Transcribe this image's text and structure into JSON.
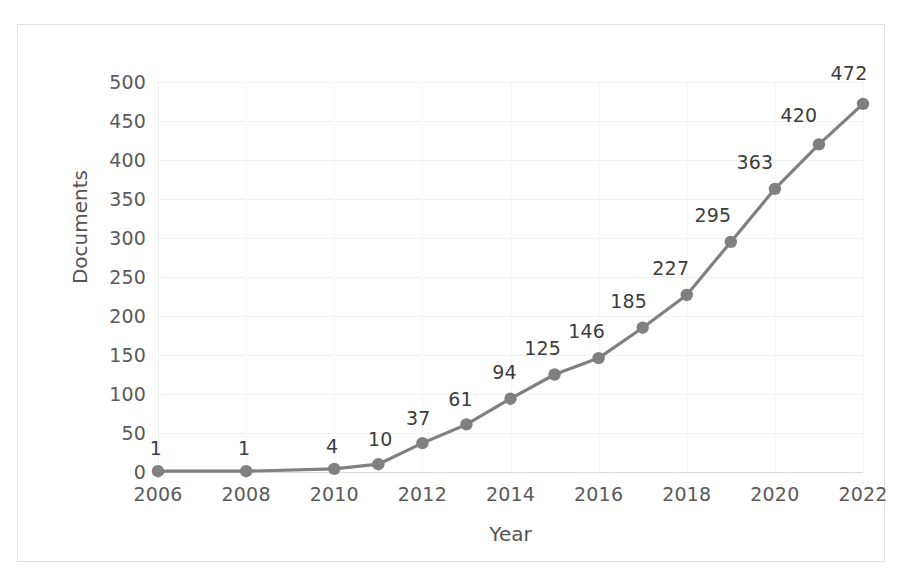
{
  "chart_data": {
    "type": "line",
    "title": "",
    "xlabel": "Year",
    "ylabel": "Documents",
    "x": [
      2006,
      2008,
      2010,
      2011,
      2012,
      2013,
      2014,
      2015,
      2016,
      2017,
      2018,
      2019,
      2020,
      2021,
      2022
    ],
    "values": [
      1,
      1,
      4,
      10,
      37,
      61,
      94,
      125,
      146,
      185,
      227,
      295,
      363,
      420,
      472
    ],
    "data_labels": [
      "1",
      "1",
      "4",
      "10",
      "37",
      "61",
      "94",
      "125",
      "146",
      "185",
      "227",
      "295",
      "363",
      "420",
      "472"
    ],
    "series": [
      {
        "name": "Documents",
        "values": [
          1,
          1,
          4,
          10,
          37,
          61,
          94,
          125,
          146,
          185,
          227,
          295,
          363,
          420,
          472
        ]
      }
    ],
    "xlim": [
      2006,
      2022
    ],
    "ylim": [
      0,
      500
    ],
    "ytick_labels": [
      "500",
      "450",
      "400",
      "350",
      "300",
      "250",
      "200",
      "150",
      "100",
      "50",
      "0"
    ],
    "ytick_values": [
      500,
      450,
      400,
      350,
      300,
      250,
      200,
      150,
      100,
      50,
      0
    ],
    "xtick_labels": [
      "2006",
      "2008",
      "2010",
      "2012",
      "2014",
      "2016",
      "2018",
      "2020",
      "2022"
    ],
    "xtick_values": [
      2006,
      2008,
      2010,
      2012,
      2014,
      2016,
      2018,
      2020,
      2022
    ],
    "grid": true,
    "legend": "none",
    "line_color": "#808080",
    "marker_color": "#808080",
    "marker_shape": "circle",
    "gridline_color": "#e8e8e8",
    "axis_text_color": "#5a5a5a",
    "label_text_color": "#3d3d3d",
    "background_color": "#ffffff",
    "frame_color": "#e2e2e2"
  }
}
